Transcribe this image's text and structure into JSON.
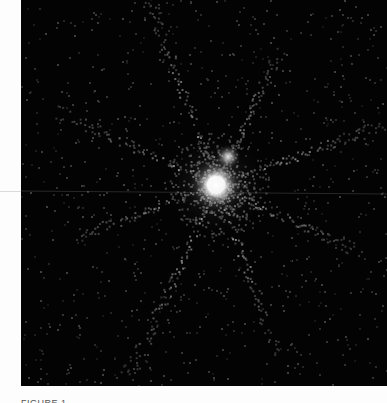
{
  "image": {
    "description": "Astronomical telescope image: bright star with diffraction spikes and a fainter companion star on a dark noisy background",
    "background_color": "#030303",
    "frame_color": "#fdfdfd",
    "primary_star": {
      "x": 195,
      "y": 185,
      "core_radius": 12,
      "color": "#ffffff"
    },
    "secondary_star": {
      "x": 207,
      "y": 157,
      "core_radius": 5,
      "color": "#e8e8e8"
    },
    "spikes_deg": [
      25,
      70,
      115,
      160,
      205,
      250,
      295,
      340
    ],
    "scan_line_y": 191
  },
  "caption": {
    "text": "FIGURE 1."
  }
}
